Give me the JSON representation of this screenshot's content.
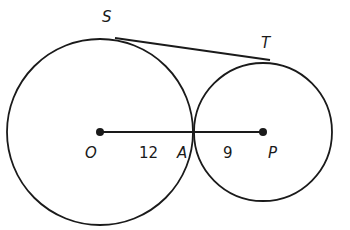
{
  "diagram": {
    "points": {
      "S": "S",
      "T": "T",
      "O": "O",
      "A": "A",
      "P": "P"
    },
    "segment_labels": {
      "OA": "12",
      "AP": "9"
    },
    "stroke_color": "#1a1a1a"
  }
}
